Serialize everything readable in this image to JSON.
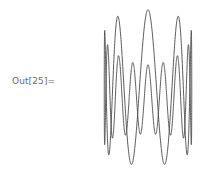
{
  "cell": {
    "output_label": "Out[25]="
  },
  "graphic": {
    "type": "ParametricPlot3D",
    "description": "sine wave wrapped around a cylinder, viewed in perspective from slightly above",
    "line_color": "#4a4a4a",
    "oscillations": 12,
    "radius": 1.0,
    "amplitude": 1.0,
    "center_x": 148,
    "center_y": 88
  }
}
